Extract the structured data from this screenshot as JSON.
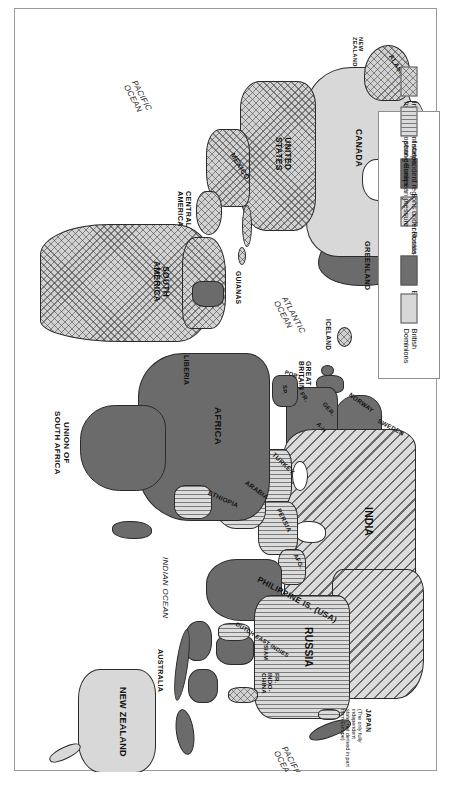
{
  "map": {
    "title": "World Imperialism c.1900",
    "orientation": "rotated-90-clockwise",
    "frame": true,
    "colors": {
      "europe": "#6e6e6e",
      "european_colonies": "#6b6b6b",
      "british_dominions": "#d8d8d8",
      "independent_former_colonies": "#d2d2d2",
      "independent_under_pressure": "#dcdcdc",
      "russia": "#dcdcdc",
      "outline": "#2b2b2b",
      "paper": "#ffffff"
    },
    "labels": [
      {
        "id": "japan",
        "text": "JAPAN",
        "category": "country"
      },
      {
        "id": "japan-note",
        "text": "(The only fully independent\nstate, not derived in part\nfrom Europe)",
        "category": "note"
      },
      {
        "id": "pacific-ocean-n",
        "text": "PACIFIC\nOCEAN",
        "category": "ocean"
      },
      {
        "id": "pacific-ocean-s",
        "text": "PACIFIC\nOCEAN",
        "category": "ocean"
      },
      {
        "id": "atlantic-ocean",
        "text": "ATLANTIC\nOCEAN",
        "category": "ocean"
      },
      {
        "id": "indian-ocean",
        "text": "INDIAN OCEAN",
        "category": "ocean"
      },
      {
        "id": "china",
        "text": "CHINA",
        "category": "country"
      },
      {
        "id": "russia",
        "text": "RUSSIA",
        "category": "country"
      },
      {
        "id": "india",
        "text": "INDIA",
        "category": "country"
      },
      {
        "id": "philippine-is",
        "text": "PHILIPPINE IS.\n(USA)",
        "category": "country"
      },
      {
        "id": "fr-indo-china",
        "text": "FR.\nINDO-\nCHINA",
        "category": "country"
      },
      {
        "id": "siam",
        "text": "SIAM",
        "category": "country"
      },
      {
        "id": "dutch-east-indies",
        "text": "DUTCH\nEAST INDIES",
        "category": "country"
      },
      {
        "id": "australia",
        "text": "AUSTRALIA",
        "category": "country"
      },
      {
        "id": "new-zealand",
        "text": "NEW\nZEALAND",
        "category": "country"
      },
      {
        "id": "africa",
        "text": "AFRICA",
        "category": "continent"
      },
      {
        "id": "liberia",
        "text": "LIBERIA",
        "category": "country"
      },
      {
        "id": "ethiopia",
        "text": "ETHIOPIA",
        "category": "country"
      },
      {
        "id": "arabia",
        "text": "ARABIA",
        "category": "country"
      },
      {
        "id": "persia",
        "text": "PERSIA",
        "category": "country"
      },
      {
        "id": "afg",
        "text": "AFG.",
        "category": "country"
      },
      {
        "id": "turkey",
        "text": "TURKEY",
        "category": "country"
      },
      {
        "id": "union-south-africa",
        "text": "UNION OF\nSOUTH AFRICA",
        "category": "country"
      },
      {
        "id": "sweden",
        "text": "SWEDEN",
        "category": "country"
      },
      {
        "id": "norway",
        "text": "NORWAY",
        "category": "country"
      },
      {
        "id": "iceland",
        "text": "ICELAND",
        "category": "country"
      },
      {
        "id": "great-britain",
        "text": "GREAT\nBRITAIN",
        "category": "country"
      },
      {
        "id": "ger",
        "text": "GER.",
        "category": "country"
      },
      {
        "id": "a-h",
        "text": "A-H",
        "category": "country"
      },
      {
        "id": "fr",
        "text": "FR.",
        "category": "country"
      },
      {
        "id": "sp",
        "text": "SP.",
        "category": "country"
      },
      {
        "id": "port",
        "text": "PORT.",
        "category": "country"
      },
      {
        "id": "greenland",
        "text": "GREENLAND",
        "category": "country"
      },
      {
        "id": "canada",
        "text": "CANADA",
        "category": "country"
      },
      {
        "id": "united-states",
        "text": "UNITED\nSTATES",
        "category": "country"
      },
      {
        "id": "alaska",
        "text": "ALASKA",
        "category": "country"
      },
      {
        "id": "mexico",
        "text": "MEXICO",
        "category": "country"
      },
      {
        "id": "central-america",
        "text": "CENTRAL\nAMERICA",
        "category": "continent"
      },
      {
        "id": "south-america",
        "text": "SOUTH\nAMERICA",
        "category": "continent"
      },
      {
        "id": "guianas",
        "text": "GUIANAS",
        "category": "country"
      }
    ]
  },
  "legend": {
    "items": [
      {
        "id": "europe",
        "label": "Europe",
        "pattern": "solid-dark-gray"
      },
      {
        "id": "colonies",
        "label": "European colonies",
        "pattern": "solid-dark-gray"
      },
      {
        "id": "independent",
        "label": "Independent states,\nformer European colonies",
        "pattern": "crosshatch"
      },
      {
        "id": "dominions",
        "label": "British\nDominions",
        "pattern": "solid-light-gray"
      },
      {
        "id": "russia",
        "label": "Russia",
        "pattern": "diagonal-stripes"
      },
      {
        "id": "pressure",
        "label": "Independent regions under\nstrong European pressure",
        "pattern": "vertical-stripes"
      }
    ]
  }
}
